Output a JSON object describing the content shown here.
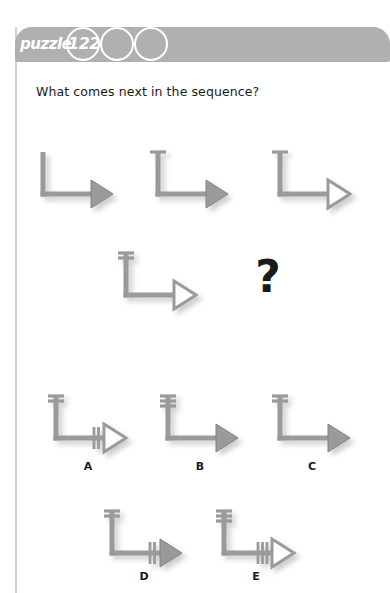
{
  "header": {
    "label": "puzzle",
    "number": "122",
    "circles": [
      "122",
      "",
      ""
    ],
    "bar_color": "#b0b0b0",
    "circle_stroke": "#ffffff"
  },
  "question": {
    "text": "What comes next in the sequence?"
  },
  "placeholder": {
    "symbol": "?"
  },
  "figure_style": {
    "arrow_color": "#9a9a9a",
    "arrow_edge": "#808080",
    "shadow_color": "#cccccc"
  },
  "sequence": [
    {
      "name": "sequence-figure-1",
      "crossbars": 0,
      "fletching": 0,
      "head": "solid"
    },
    {
      "name": "sequence-figure-2",
      "crossbars": 1,
      "fletching": 0,
      "head": "solid"
    },
    {
      "name": "sequence-figure-3",
      "crossbars": 1,
      "fletching": 0,
      "head": "hollow"
    },
    {
      "name": "sequence-figure-4",
      "crossbars": 2,
      "fletching": 0,
      "head": "hollow"
    }
  ],
  "options": [
    {
      "label": "A",
      "crossbars": 2,
      "fletching": 2,
      "head": "hollow"
    },
    {
      "label": "B",
      "crossbars": 3,
      "fletching": 0,
      "head": "solid"
    },
    {
      "label": "C",
      "crossbars": 2,
      "fletching": 0,
      "head": "solid"
    },
    {
      "label": "D",
      "crossbars": 2,
      "fletching": 2,
      "head": "solid"
    },
    {
      "label": "E",
      "crossbars": 3,
      "fletching": 3,
      "head": "hollow"
    }
  ]
}
